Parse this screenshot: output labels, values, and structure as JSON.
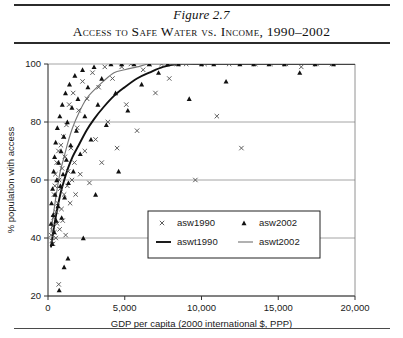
{
  "figure": {
    "number": "Figure 2.7",
    "title": "Access to Safe Water vs. Income, 1990–2002"
  },
  "chart_data": {
    "type": "scatter",
    "title": "Access to Safe Water vs. Income, 1990–2002",
    "xlabel": "GDP per capita (2000 international $, PPP)",
    "ylabel": "% population with access",
    "xlim": [
      0,
      20000
    ],
    "ylim": [
      20,
      100
    ],
    "xticks": [
      0,
      5000,
      10000,
      15000,
      20000
    ],
    "xtick_labels": [
      "0",
      "5,000",
      "10,000",
      "15,000",
      "20,000"
    ],
    "yticks": [
      20,
      40,
      60,
      80,
      100
    ],
    "ytick_labels": [
      "20",
      "40",
      "60",
      "80",
      "100"
    ],
    "grid": "horizontal",
    "legend_position": "inside-lower-center",
    "series": [
      {
        "name": "asw1990",
        "type": "scatter",
        "marker": "x",
        "color": "#555555",
        "points": [
          [
            210,
            41
          ],
          [
            250,
            39
          ],
          [
            300,
            44
          ],
          [
            330,
            38
          ],
          [
            360,
            47
          ],
          [
            390,
            55
          ],
          [
            420,
            42
          ],
          [
            450,
            58
          ],
          [
            480,
            62
          ],
          [
            510,
            40
          ],
          [
            540,
            49
          ],
          [
            570,
            66
          ],
          [
            600,
            45
          ],
          [
            640,
            52
          ],
          [
            680,
            70
          ],
          [
            700,
            24
          ],
          [
            720,
            60
          ],
          [
            760,
            43
          ],
          [
            800,
            57
          ],
          [
            840,
            72
          ],
          [
            880,
            50
          ],
          [
            920,
            64
          ],
          [
            960,
            46
          ],
          [
            1000,
            75
          ],
          [
            1050,
            55
          ],
          [
            1100,
            68
          ],
          [
            1150,
            41
          ],
          [
            1200,
            79
          ],
          [
            1260,
            58
          ],
          [
            1320,
            63
          ],
          [
            1380,
            86
          ],
          [
            1440,
            52
          ],
          [
            1500,
            71
          ],
          [
            1560,
            60
          ],
          [
            1640,
            90
          ],
          [
            1720,
            66
          ],
          [
            1800,
            55
          ],
          [
            1900,
            78
          ],
          [
            2000,
            84
          ],
          [
            2100,
            62
          ],
          [
            2250,
            94
          ],
          [
            2400,
            70
          ],
          [
            2550,
            88
          ],
          [
            2700,
            59
          ],
          [
            2900,
            97
          ],
          [
            3100,
            74
          ],
          [
            3300,
            92
          ],
          [
            3500,
            66
          ],
          [
            3700,
            99
          ],
          [
            3900,
            80
          ],
          [
            4200,
            95
          ],
          [
            4500,
            71
          ],
          [
            4800,
            99
          ],
          [
            5100,
            86
          ],
          [
            5400,
            100
          ],
          [
            5800,
            77
          ],
          [
            6200,
            98
          ],
          [
            6600,
            100
          ],
          [
            7000,
            90
          ],
          [
            7400,
            100
          ],
          [
            7900,
            95
          ],
          [
            8400,
            100
          ],
          [
            9000,
            100
          ],
          [
            9600,
            60
          ],
          [
            10200,
            100
          ],
          [
            11000,
            82
          ],
          [
            11800,
            100
          ],
          [
            12600,
            71
          ],
          [
            13500,
            100
          ],
          [
            14500,
            100
          ],
          [
            15500,
            100
          ],
          [
            16500,
            99
          ],
          [
            17500,
            100
          ],
          [
            18500,
            100
          ]
        ]
      },
      {
        "name": "asw2002",
        "type": "scatter",
        "marker": "triangle",
        "color": "#111111",
        "points": [
          [
            200,
            45
          ],
          [
            230,
            52
          ],
          [
            270,
            38
          ],
          [
            300,
            57
          ],
          [
            340,
            48
          ],
          [
            370,
            63
          ],
          [
            400,
            42
          ],
          [
            430,
            68
          ],
          [
            460,
            55
          ],
          [
            500,
            73
          ],
          [
            530,
            46
          ],
          [
            570,
            60
          ],
          [
            610,
            78
          ],
          [
            650,
            51
          ],
          [
            690,
            66
          ],
          [
            730,
            22
          ],
          [
            770,
            82
          ],
          [
            810,
            58
          ],
          [
            850,
            70
          ],
          [
            890,
            47
          ],
          [
            930,
            86
          ],
          [
            980,
            62
          ],
          [
            1030,
            75
          ],
          [
            1080,
            54
          ],
          [
            1140,
            90
          ],
          [
            1200,
            67
          ],
          [
            1260,
            80
          ],
          [
            1330,
            59
          ],
          [
            1400,
            93
          ],
          [
            1480,
            72
          ],
          [
            1560,
            85
          ],
          [
            1650,
            63
          ],
          [
            1750,
            96
          ],
          [
            1850,
            77
          ],
          [
            1950,
            88
          ],
          [
            2100,
            69
          ],
          [
            2250,
            98
          ],
          [
            2400,
            82
          ],
          [
            2600,
            92
          ],
          [
            2800,
            74
          ],
          [
            3000,
            99
          ],
          [
            3250,
            86
          ],
          [
            3500,
            95
          ],
          [
            3800,
            79
          ],
          [
            4100,
            100
          ],
          [
            4400,
            90
          ],
          [
            4800,
            100
          ],
          [
            5200,
            84
          ],
          [
            5600,
            100
          ],
          [
            6100,
            93
          ],
          [
            6600,
            100
          ],
          [
            7200,
            97
          ],
          [
            7800,
            100
          ],
          [
            8500,
            100
          ],
          [
            9200,
            88
          ],
          [
            10000,
            100
          ],
          [
            10800,
            100
          ],
          [
            11600,
            94
          ],
          [
            12500,
            100
          ],
          [
            13400,
            100
          ],
          [
            14400,
            100
          ],
          [
            15400,
            100
          ],
          [
            16400,
            97
          ],
          [
            17400,
            100
          ],
          [
            18600,
            100
          ],
          [
            1050,
            30
          ],
          [
            1300,
            33
          ],
          [
            2300,
            40
          ],
          [
            3100,
            55
          ],
          [
            4600,
            63
          ]
        ]
      },
      {
        "name": "aswt1990",
        "type": "line",
        "style": "thick-dark",
        "color": "#111111",
        "description": "Fitted logarithmic trend for 1990, rising from ~38% near GDP 200 to 100% near GDP 9,500",
        "points": [
          [
            200,
            37
          ],
          [
            400,
            44
          ],
          [
            600,
            50
          ],
          [
            800,
            55
          ],
          [
            1000,
            59
          ],
          [
            1300,
            64
          ],
          [
            1600,
            68
          ],
          [
            2000,
            72
          ],
          [
            2500,
            77
          ],
          [
            3000,
            81
          ],
          [
            3600,
            85
          ],
          [
            4300,
            89
          ],
          [
            5000,
            92
          ],
          [
            5800,
            95
          ],
          [
            6600,
            97
          ],
          [
            7500,
            99
          ],
          [
            8500,
            100
          ],
          [
            9500,
            100
          ],
          [
            12000,
            100
          ],
          [
            16000,
            100
          ],
          [
            20000,
            100
          ]
        ]
      },
      {
        "name": "aswt2002",
        "type": "line",
        "style": "thin-gray",
        "color": "#777777",
        "description": "Fitted logarithmic trend for 2002, above the 1990 curve, rising from ~42% near GDP 200 to 100% near GDP 7,000",
        "points": [
          [
            200,
            42
          ],
          [
            400,
            50
          ],
          [
            600,
            57
          ],
          [
            800,
            63
          ],
          [
            1000,
            67
          ],
          [
            1300,
            73
          ],
          [
            1600,
            78
          ],
          [
            2000,
            83
          ],
          [
            2500,
            88
          ],
          [
            3000,
            91
          ],
          [
            3600,
            94
          ],
          [
            4300,
            97
          ],
          [
            5000,
            98
          ],
          [
            5800,
            99
          ],
          [
            6600,
            100
          ],
          [
            7500,
            100
          ],
          [
            9000,
            100
          ],
          [
            12000,
            100
          ],
          [
            16000,
            100
          ],
          [
            20000,
            100
          ]
        ]
      }
    ],
    "legend": [
      {
        "label": "asw1990",
        "marker": "x"
      },
      {
        "label": "asw2002",
        "marker": "triangle"
      },
      {
        "label": "aswt1990",
        "marker": "line-thick"
      },
      {
        "label": "aswt2002",
        "marker": "line-thin"
      }
    ]
  }
}
